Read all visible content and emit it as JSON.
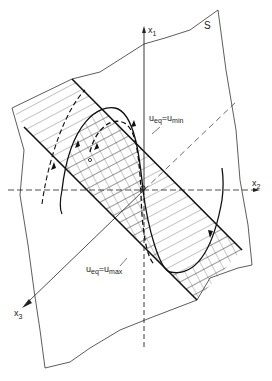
{
  "figure": {
    "plane_label": "S",
    "axes": {
      "x1": {
        "base": "x",
        "sub": "1"
      },
      "x2": {
        "base": "x",
        "sub": "2"
      },
      "x3": {
        "base": "x",
        "sub": "3"
      }
    },
    "boundary_upper": {
      "lhs_base": "u",
      "lhs_sub": "eq",
      "eq": "=",
      "rhs_base": "u",
      "rhs_sub": "min"
    },
    "boundary_lower": {
      "lhs_base": "u",
      "lhs_sub": "eq",
      "eq": "=",
      "rhs_base": "u",
      "rhs_sub": "max"
    },
    "colors": {
      "ink": "#222222",
      "hatch": "#555555",
      "background": "#ffffff"
    }
  }
}
